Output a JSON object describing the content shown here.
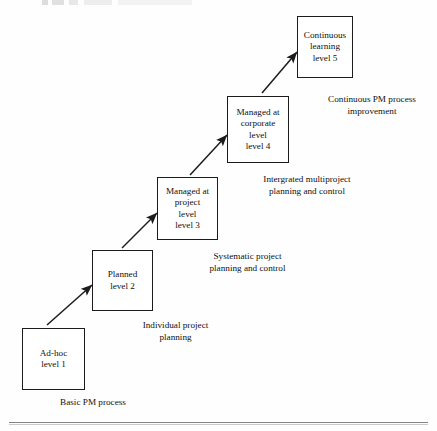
{
  "diagram": {
    "type": "staircase-maturity-diagram",
    "ink_color": "#1c1c1c",
    "background_color": "#ffffff",
    "nodes": [
      {
        "id": "level-1",
        "lines": [
          "Ad-hoc",
          "level 1"
        ],
        "caption_lines": [
          "Basic PM process"
        ]
      },
      {
        "id": "level-2",
        "lines": [
          "Planned",
          "level 2"
        ],
        "caption_lines": [
          "Individual project",
          "planning"
        ]
      },
      {
        "id": "level-3",
        "lines": [
          "Managed at",
          "project",
          "level",
          "level 3"
        ],
        "caption_lines": [
          "Systematic project",
          "planning and control"
        ]
      },
      {
        "id": "level-4",
        "lines": [
          "Managed at",
          "corporate",
          "level",
          "level 4"
        ],
        "caption_lines": [
          "Intergrated multiproject",
          "planning and control"
        ]
      },
      {
        "id": "level-5",
        "lines": [
          "Continuous",
          "learning",
          "level 5"
        ],
        "caption_lines": [
          "Continuous PM process",
          "improvement"
        ]
      }
    ],
    "arrows": [
      {
        "id": "arrow-1-to-2",
        "from": "level-1",
        "to": "level-2"
      },
      {
        "id": "arrow-2-to-3",
        "from": "level-2",
        "to": "level-3"
      },
      {
        "id": "arrow-3-to-4",
        "from": "level-3",
        "to": "level-4"
      },
      {
        "id": "arrow-4-to-5",
        "from": "level-4",
        "to": "level-5"
      }
    ]
  }
}
